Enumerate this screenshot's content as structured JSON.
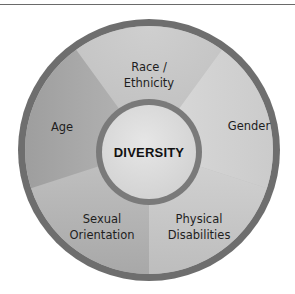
{
  "diagram": {
    "type": "segmented-wheel",
    "center_label": "DIVERSITY",
    "segments": [
      {
        "label_lines": [
          "Race /",
          "Ethnicity"
        ],
        "position": "top"
      },
      {
        "label_lines": [
          "Gender"
        ],
        "position": "right"
      },
      {
        "label_lines": [
          "Physical",
          "Disabilities"
        ],
        "position": "bottom-right"
      },
      {
        "label_lines": [
          "Sexual",
          "Orientation"
        ],
        "position": "bottom-left"
      },
      {
        "label_lines": [
          "Age"
        ],
        "position": "left"
      }
    ]
  },
  "colors": {
    "outer_ring": "#6e6e6e",
    "inner_ring": "#7a7a7a",
    "segment_top": "#c4c4c4",
    "segment_right": "#d2d2d2",
    "segment_bottom_right": "#c9c9c9",
    "segment_bottom_left": "#b4b4b4",
    "segment_left": "#a9a9a9",
    "center_fill": "#dcdcdc",
    "rule": "#6a6a6a"
  }
}
